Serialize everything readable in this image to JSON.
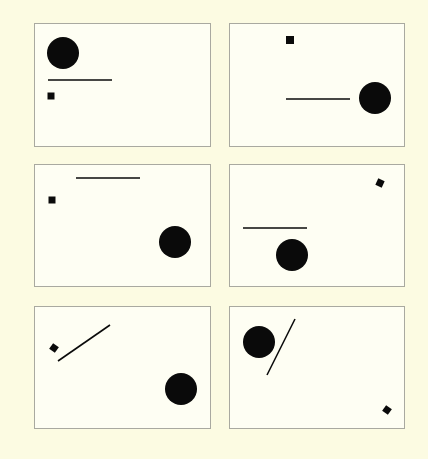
{
  "figure": {
    "background": "#fcfbe2",
    "panel_background": "#fefef3",
    "panel_border": "#a9a9a0",
    "shape_color": "#0a0a0a",
    "panels": [
      {
        "id": "panel-1",
        "box": {
          "x": 34,
          "y": 23,
          "w": 177,
          "h": 124
        },
        "circle": {
          "cx": 28,
          "cy": 29,
          "r": 16
        },
        "line": {
          "x1": 13,
          "y1": 56,
          "x2": 77,
          "y2": 56
        },
        "square": {
          "cx": 16,
          "cy": 72,
          "size": 7,
          "rotate": 0
        }
      },
      {
        "id": "panel-2",
        "box": {
          "x": 229,
          "y": 23,
          "w": 176,
          "h": 124
        },
        "square": {
          "cx": 60,
          "cy": 16,
          "size": 8,
          "rotate": 0
        },
        "line": {
          "x1": 56,
          "y1": 75,
          "x2": 120,
          "y2": 75
        },
        "circle": {
          "cx": 145,
          "cy": 74,
          "r": 16
        }
      },
      {
        "id": "panel-3",
        "box": {
          "x": 34,
          "y": 164,
          "w": 177,
          "h": 123
        },
        "line": {
          "x1": 41,
          "y1": 13,
          "x2": 105,
          "y2": 13
        },
        "square": {
          "cx": 17,
          "cy": 35,
          "size": 7,
          "rotate": 0
        },
        "circle": {
          "cx": 140,
          "cy": 77,
          "r": 16
        }
      },
      {
        "id": "panel-4",
        "box": {
          "x": 229,
          "y": 164,
          "w": 176,
          "h": 123
        },
        "square": {
          "cx": 150,
          "cy": 18,
          "size": 7,
          "rotate": 25
        },
        "line": {
          "x1": 13,
          "y1": 63,
          "x2": 77,
          "y2": 63
        },
        "circle": {
          "cx": 62,
          "cy": 90,
          "r": 16
        }
      },
      {
        "id": "panel-5",
        "box": {
          "x": 34,
          "y": 306,
          "w": 177,
          "h": 123
        },
        "square": {
          "cx": 19,
          "cy": 41,
          "size": 7,
          "rotate": 35
        },
        "line": {
          "x1": 23,
          "y1": 54,
          "x2": 75,
          "y2": 18
        },
        "circle": {
          "cx": 146,
          "cy": 82,
          "r": 16
        }
      },
      {
        "id": "panel-6",
        "box": {
          "x": 229,
          "y": 306,
          "w": 176,
          "h": 123
        },
        "circle": {
          "cx": 29,
          "cy": 35,
          "r": 16
        },
        "line": {
          "x1": 37,
          "y1": 68,
          "x2": 65,
          "y2": 12
        },
        "square": {
          "cx": 157,
          "cy": 103,
          "size": 7,
          "rotate": 35
        }
      }
    ]
  }
}
